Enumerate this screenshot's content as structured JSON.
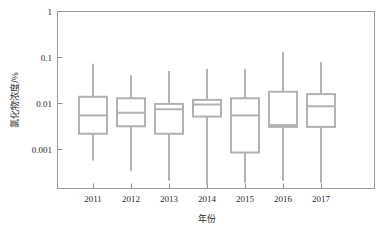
{
  "chart_data": {
    "type": "box",
    "title": "",
    "xlabel": "年份",
    "ylabel": "氯化物浓度/%",
    "yscale": "log",
    "ylim": [
      0.0002,
      1
    ],
    "grid": false,
    "legend": null,
    "categories": [
      "2011",
      "2012",
      "2013",
      "2014",
      "2015",
      "2016",
      "2017"
    ],
    "ytick_labels": [
      "1",
      "0.1",
      "0.01",
      "0.001"
    ],
    "ytick_values": [
      1,
      0.1,
      0.01,
      0.001
    ],
    "boxes": [
      {
        "category": "2011",
        "whisker_low": 0.00058,
        "q1": 0.0022,
        "median": 0.0055,
        "q3": 0.014,
        "whisker_high": 0.073
      },
      {
        "category": "2012",
        "whisker_low": 0.00034,
        "q1": 0.0032,
        "median": 0.0063,
        "q3": 0.013,
        "whisker_high": 0.041
      },
      {
        "category": "2013",
        "whisker_low": 0.00021,
        "q1": 0.0022,
        "median": 0.0075,
        "q3": 0.0098,
        "whisker_high": 0.051
      },
      {
        "category": "2014",
        "whisker_low": 0.00017,
        "q1": 0.0052,
        "median": 0.0095,
        "q3": 0.012,
        "whisker_high": 0.056
      },
      {
        "category": "2015",
        "whisker_low": 0.00019,
        "q1": 0.00086,
        "median": 0.0055,
        "q3": 0.013,
        "whisker_high": 0.056
      },
      {
        "category": "2016",
        "whisker_low": 0.00021,
        "q1": 0.0031,
        "median": 0.0034,
        "q3": 0.018,
        "whisker_high": 0.13
      },
      {
        "category": "2017",
        "whisker_low": 0.00019,
        "q1": 0.0031,
        "median": 0.0087,
        "q3": 0.016,
        "whisker_high": 0.079
      }
    ]
  },
  "colors": {
    "box_stroke": "#b2b2b2",
    "box_fill": "#ffffff",
    "frame": "#9a9a9a",
    "text": "#2b2b2b",
    "background": "#ffffff"
  }
}
